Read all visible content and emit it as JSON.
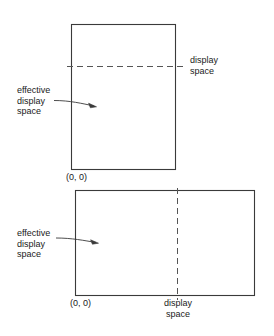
{
  "figure": {
    "background_color": "#ffffff",
    "stroke_color": "#3a3a3a",
    "dash_color": "#555555",
    "text_color": "#1a1a1a"
  },
  "diagrams": [
    {
      "id": "portrait-display",
      "orientation": "portrait",
      "rect": {
        "x": 71,
        "y": 24,
        "width": 104,
        "height": 145
      },
      "divider": {
        "type": "horizontal-dashed",
        "y": 66,
        "x_start": 67,
        "x_end": 186
      },
      "origin_label": "(0, 0)",
      "effective_label_lines": [
        "effective",
        "display",
        "space"
      ],
      "display_label_lines": [
        "display",
        "space"
      ]
    },
    {
      "id": "landscape-display",
      "orientation": "landscape",
      "rect": {
        "x": 75,
        "y": 190,
        "width": 179,
        "height": 105
      },
      "divider": {
        "type": "vertical-dashed",
        "x": 177,
        "y_start": 188,
        "y_end": 300
      },
      "origin_label": "(0, 0)",
      "effective_label_lines": [
        "effective",
        "display",
        "space"
      ],
      "display_label_lines": [
        "display",
        "space"
      ]
    }
  ],
  "labels": {
    "top_display_space": "display\nspace",
    "top_effective": "effective\ndisplay\nspace",
    "top_origin": "(0, 0)",
    "bottom_effective": "effective\ndisplay\nspace",
    "bottom_origin": "(0, 0)",
    "bottom_display_space": "display\nspace"
  }
}
